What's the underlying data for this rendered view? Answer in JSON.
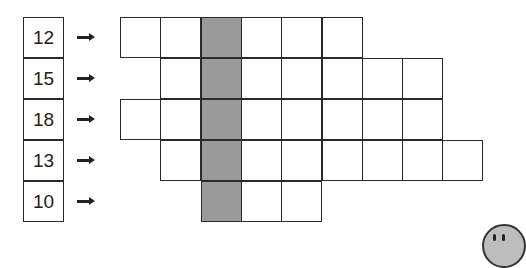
{
  "diagram": {
    "rows": [
      {
        "label": "12",
        "start_col": 0,
        "cells": 6
      },
      {
        "label": "15",
        "start_col": 1,
        "cells": 7
      },
      {
        "label": "18",
        "start_col": 0,
        "cells": 8
      },
      {
        "label": "13",
        "start_col": 1,
        "cells": 8
      },
      {
        "label": "10",
        "start_col": 2,
        "cells": 3
      }
    ],
    "shaded_column_index": 2,
    "colors": {
      "shaded": "#9a9a9a",
      "border": "#2a2a2a",
      "background": "#ffffff"
    },
    "icons": {
      "arrow": "right-arrow-icon",
      "mascot": "mascot-face-icon"
    }
  }
}
